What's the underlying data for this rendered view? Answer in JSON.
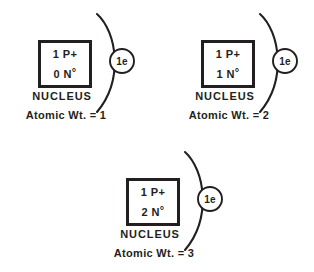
{
  "diagram": {
    "ink_color": "#231f20",
    "background_color": "#ffffff",
    "atoms": [
      {
        "protons_label": "1 P+",
        "neutrons_count": "0",
        "neutrons_symbol": "N",
        "neutrons_degree": "°",
        "nucleus_caption": "NUCLEUS",
        "electron_label": "1e",
        "atomic_weight_label": "Atomic Wt. = 1"
      },
      {
        "protons_label": "1 P+",
        "neutrons_count": "1",
        "neutrons_symbol": "N",
        "neutrons_degree": "°",
        "nucleus_caption": "NUCLEUS",
        "electron_label": "1e",
        "atomic_weight_label": "Atomic Wt. = 2"
      },
      {
        "protons_label": "1 P+",
        "neutrons_count": "2",
        "neutrons_symbol": "N",
        "neutrons_degree": "°",
        "nucleus_caption": "NUCLEUS",
        "electron_label": "1e",
        "atomic_weight_label": "Atomic Wt. = 3"
      }
    ]
  }
}
